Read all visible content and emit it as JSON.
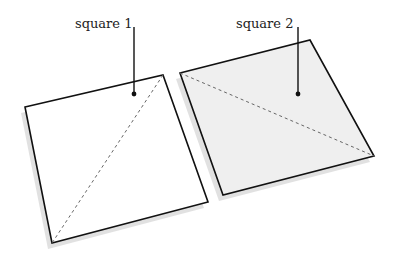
{
  "diagram": {
    "squares": [
      {
        "label": "square 1",
        "fill": "#ffffff",
        "corners": [
          [
            25,
            107
          ],
          [
            163,
            75
          ],
          [
            208,
            202
          ],
          [
            52,
            243
          ]
        ],
        "diagonal": [
          [
            163,
            75
          ],
          [
            52,
            243
          ]
        ],
        "dot": [
          134,
          94
        ],
        "label_pos": [
          75,
          14
        ]
      },
      {
        "label": "square 2",
        "fill": "#efefef",
        "corners": [
          [
            180,
            73
          ],
          [
            310,
            40
          ],
          [
            374,
            156
          ],
          [
            223,
            195
          ]
        ],
        "diagonal": [
          [
            180,
            73
          ],
          [
            374,
            156
          ]
        ],
        "dot": [
          298,
          94
        ],
        "label_pos": [
          236,
          14
        ]
      }
    ],
    "colors": {
      "stroke": "#111111",
      "shadow": "#d6d6d6",
      "dash": "#666666"
    }
  }
}
